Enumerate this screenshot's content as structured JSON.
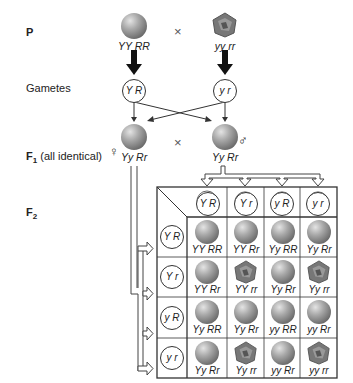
{
  "rows": {
    "p_label": "P",
    "gametes_label": "Gametes",
    "f1_label": "F",
    "f1_sub": "1",
    "f1_note": "(all identical)",
    "f2_label": "F",
    "f2_sub": "2"
  },
  "parents": {
    "left": {
      "genotype": "YY RR",
      "phenotype": "round-yellow"
    },
    "right": {
      "genotype": "yy rr",
      "phenotype": "wrinkled-green"
    },
    "cross_symbol": "×"
  },
  "gametes": {
    "left": "Y R",
    "right": "y r"
  },
  "f1": {
    "female_symbol": "♀",
    "male_symbol": "♂",
    "cross_symbol": "×",
    "left_genotype": "Yy Rr",
    "right_genotype": "Yy Rr"
  },
  "punnett": {
    "col_gametes": [
      "Y R",
      "Y r",
      "y R",
      "y r"
    ],
    "row_gametes": [
      "Y R",
      "Y r",
      "y R",
      "y r"
    ],
    "cells": [
      [
        {
          "g": "YY RR",
          "w": false
        },
        {
          "g": "YY Rr",
          "w": false
        },
        {
          "g": "Yy RR",
          "w": false
        },
        {
          "g": "Yy Rr",
          "w": false
        }
      ],
      [
        {
          "g": "YY Rr",
          "w": false
        },
        {
          "g": "YY rr",
          "w": true
        },
        {
          "g": "Yy Rr",
          "w": false
        },
        {
          "g": "Yy rr",
          "w": true
        }
      ],
      [
        {
          "g": "Yy RR",
          "w": false
        },
        {
          "g": "Yy Rr",
          "w": false
        },
        {
          "g": "yy RR",
          "w": false
        },
        {
          "g": "yy Rr",
          "w": false
        }
      ],
      [
        {
          "g": "Yy Rr",
          "w": false
        },
        {
          "g": "Yy rr",
          "w": true
        },
        {
          "g": "yy Rr",
          "w": false
        },
        {
          "g": "yy rr",
          "w": true
        }
      ]
    ]
  }
}
